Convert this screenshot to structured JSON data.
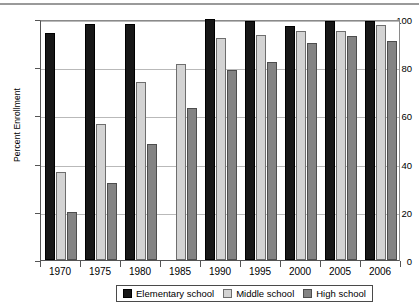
{
  "chart_data": {
    "type": "bar",
    "title": "",
    "xlabel": "",
    "ylabel": "Percent Enrollment",
    "ylim": [
      0,
      100
    ],
    "yticks": [
      0,
      20,
      40,
      60,
      80,
      100
    ],
    "grid": true,
    "legend_position": "bottom",
    "categories": [
      "1970",
      "1975",
      "1980",
      "1985",
      "1990",
      "1995",
      "2000",
      "2005",
      "2006"
    ],
    "series": [
      {
        "name": "Elementary school",
        "color": "#171717",
        "values": [
          94,
          98,
          98,
          null,
          100,
          99,
          97,
          99,
          99
        ]
      },
      {
        "name": "Middle school",
        "color": "#d3d3d3",
        "values": [
          36.5,
          56.5,
          74,
          81.5,
          92,
          93.5,
          95,
          95,
          97.5
        ]
      },
      {
        "name": "High school",
        "color": "#838383",
        "values": [
          20,
          32,
          48,
          63,
          79,
          82,
          90,
          93,
          91
        ]
      }
    ]
  },
  "axis": {
    "y_title": "Percent Enrollment",
    "y_tick_labels": [
      "100",
      "80",
      "60",
      "40",
      "20",
      "0"
    ],
    "x_tick_labels": [
      "1970",
      "1975",
      "1980",
      "1985",
      "1990",
      "1995",
      "2000",
      "2005",
      "2006"
    ]
  },
  "legend": {
    "items": [
      {
        "label": "Elementary school",
        "swatch": "elementary"
      },
      {
        "label": "Middle school",
        "swatch": "middle"
      },
      {
        "label": "High school",
        "swatch": "high"
      }
    ]
  }
}
